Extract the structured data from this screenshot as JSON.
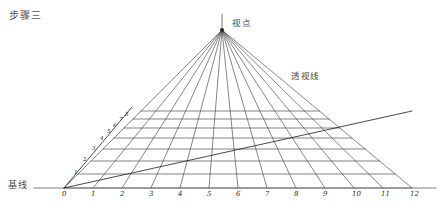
{
  "page": {
    "width": 441,
    "height": 214,
    "background": "#ffffff",
    "title": "步骤三"
  },
  "labels": {
    "vanishing_point": "视点",
    "perspective_lines": "透视线",
    "baseline": "基线"
  },
  "colors": {
    "ink": "#2a2a2a",
    "line": "#3c3c3c",
    "light_line": "#6a6a6a",
    "text": "#4a4a4a",
    "background": "#ffffff"
  },
  "chart_data": {
    "type": "diagram",
    "title": "步骤三",
    "vanishing_point": {
      "x": 222,
      "y": 30,
      "label": "视点"
    },
    "vertical_axis": {
      "x": 222,
      "y_top": 14,
      "y_bottom": 30
    },
    "baseline": {
      "y": 188,
      "x_start": 34,
      "x_end": 436,
      "label": "基线"
    },
    "baseline_ticks": {
      "labels": [
        "0",
        "1",
        "2",
        "3",
        "4",
        "5",
        "6",
        "7",
        "8",
        "9",
        "10",
        "11",
        "12"
      ],
      "x": [
        64,
        93,
        122,
        151,
        180,
        209,
        238,
        267,
        296,
        325,
        354,
        383,
        412
      ],
      "y": 188
    },
    "orthogonals": {
      "count": 13,
      "from": {
        "x": 222,
        "y": 30
      },
      "to_x": [
        64,
        93,
        122,
        151,
        180,
        209,
        238,
        267,
        296,
        325,
        354,
        383,
        412
      ],
      "to_y": 188,
      "label": "透视线"
    },
    "transversals": {
      "count": 8,
      "y": [
        188,
        174,
        161,
        149,
        138,
        128,
        119,
        111
      ],
      "note": "Horizontal lines spaced with diminishing perspective intervals"
    },
    "measuring_diagonal": {
      "from": {
        "x": 64,
        "y": 188
      },
      "to": {
        "x": 412,
        "y": 111
      },
      "note": "Diagonal from point 0 across grid to far right corner"
    },
    "left_edge_diagonal": {
      "from": {
        "x": 64,
        "y": 188
      },
      "to": {
        "x": 132,
        "y": 107
      },
      "numbers": [
        "1",
        "2",
        "3",
        "4",
        "5",
        "6",
        "7",
        "8"
      ],
      "number_x": [
        74,
        83,
        92,
        100,
        107,
        113,
        119,
        125
      ],
      "number_y": [
        169,
        156,
        145,
        135,
        128,
        122,
        116,
        111
      ]
    },
    "grid_extent": {
      "left_x_at_baseline": 64,
      "right_x_at_baseline": 412,
      "top_y": 107
    }
  }
}
